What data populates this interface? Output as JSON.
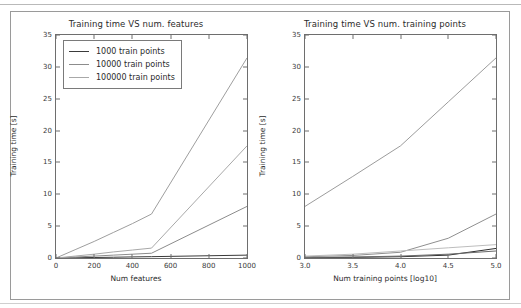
{
  "figure": {
    "background": "#ffffff",
    "frame_color": "#9a9a9a",
    "axis_color": "#6e6e6e"
  },
  "chart_data": [
    {
      "type": "line",
      "panel": "left",
      "title": "Training time VS num. features",
      "xlabel": "Num features",
      "ylabel": "Training time [s]",
      "xlim": [
        0,
        1000
      ],
      "ylim": [
        0,
        35
      ],
      "xticks": [
        0,
        200,
        400,
        600,
        800,
        1000
      ],
      "xticklabels": [
        "0",
        "200",
        "400",
        "600",
        "800",
        "1000"
      ],
      "yticks": [
        0,
        5,
        10,
        15,
        20,
        25,
        30,
        35
      ],
      "yticklabels": [
        "0",
        "5",
        "10",
        "15",
        "20",
        "25",
        "30",
        "35"
      ],
      "grid": false,
      "legend_position": "upper left",
      "x": [
        0,
        100,
        200,
        300,
        400,
        500,
        1000
      ],
      "series": [
        {
          "name": "1000 train points",
          "color": "#3b3b3b",
          "values": [
            0.0,
            0.04,
            0.08,
            0.12,
            0.17,
            0.21,
            0.45
          ]
        },
        {
          "name": "10000 train points",
          "color": "#8c8c8c",
          "values": [
            0.0,
            0.15,
            0.3,
            0.45,
            0.6,
            0.75,
            8.1
          ]
        },
        {
          "name": "100000 train points",
          "color": "#a8a8a8",
          "values": [
            0.0,
            0.3,
            0.6,
            0.95,
            1.25,
            1.55,
            17.6
          ]
        },
        {
          "name": "100000 train points (upper)",
          "color": "#9e9e9e",
          "values": [
            0.0,
            1.3,
            2.6,
            4.0,
            5.4,
            6.9,
            31.4
          ]
        }
      ]
    },
    {
      "type": "line",
      "panel": "right",
      "title": "Training time VS num. training points",
      "xlabel": "Num training points [log10]",
      "ylabel": "Training time [s]",
      "xlim": [
        3.0,
        5.0
      ],
      "ylim": [
        0,
        35
      ],
      "xticks": [
        3.0,
        3.5,
        4.0,
        4.5,
        5.0
      ],
      "xticklabels": [
        "3.0",
        "3.5",
        "4.0",
        "4.5",
        "5.0"
      ],
      "yticks": [
        0,
        5,
        10,
        15,
        20,
        25,
        30,
        35
      ],
      "yticklabels": [
        "0",
        "5",
        "10",
        "15",
        "20",
        "25",
        "30",
        "35"
      ],
      "grid": false,
      "legend_position": "upper left",
      "x": [
        3.0,
        3.5,
        4.0,
        4.5,
        5.0
      ],
      "series": [
        {
          "name": "10 features",
          "color": "#2e2e2e",
          "values": [
            0.05,
            0.1,
            0.2,
            0.45,
            1.5
          ]
        },
        {
          "name": "50 features",
          "color": "#6a6a6a",
          "values": [
            0.08,
            0.15,
            0.3,
            0.6,
            1.1
          ]
        },
        {
          "name": "100 features",
          "color": "#8f8f8f",
          "values": [
            0.2,
            0.4,
            0.9,
            3.1,
            6.9
          ]
        },
        {
          "name": "500 features",
          "color": "#bdbdbd",
          "values": [
            0.3,
            0.6,
            1.1,
            1.6,
            2.1
          ]
        },
        {
          "name": "1000 features",
          "color": "#9c9c9c",
          "values": [
            8.1,
            12.8,
            17.6,
            24.5,
            31.4
          ]
        }
      ]
    }
  ]
}
